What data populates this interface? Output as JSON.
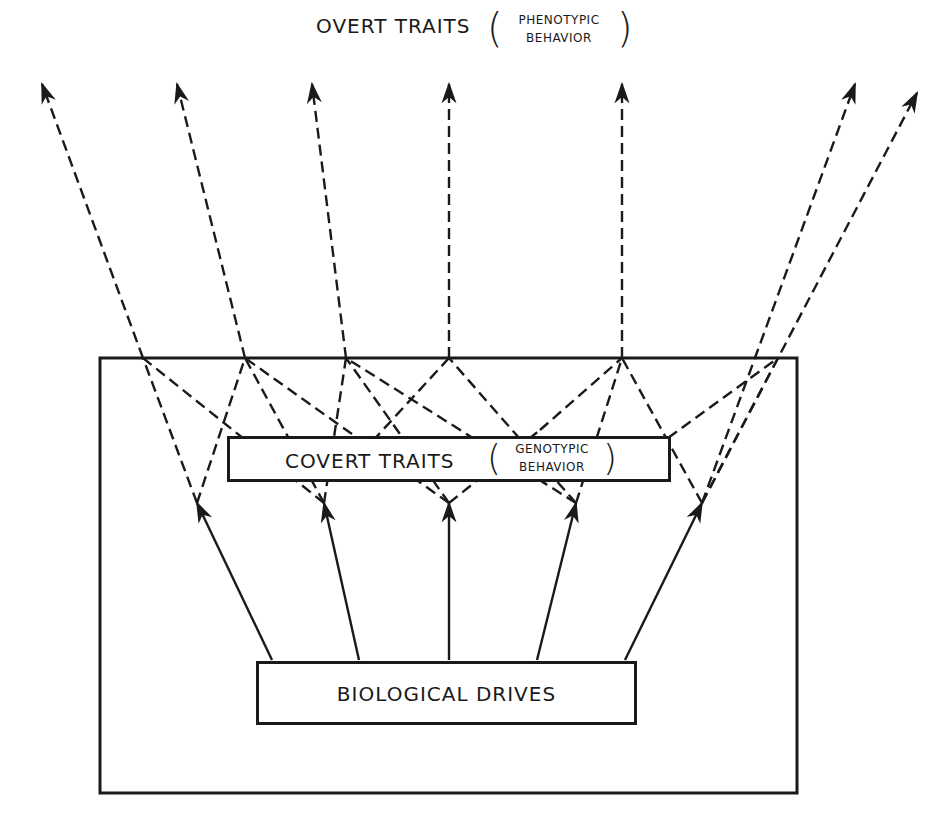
{
  "diagram": {
    "top_label": {
      "main": "OVERT TRAITS",
      "paren_open": "(",
      "paren_close": ")",
      "sub_line1": "PHENOTYPIC",
      "sub_line2": "BEHAVIOR"
    },
    "covert_box": {
      "main": "COVERT TRAITS",
      "paren_open": "(",
      "paren_close": ")",
      "sub_line1": "GENOTYPIC",
      "sub_line2": "BEHAVIOR"
    },
    "drives_box": {
      "label": "BIOLOGICAL DRIVES"
    },
    "colors": {
      "line": "#1a1a1a",
      "background": "#ffffff"
    }
  }
}
